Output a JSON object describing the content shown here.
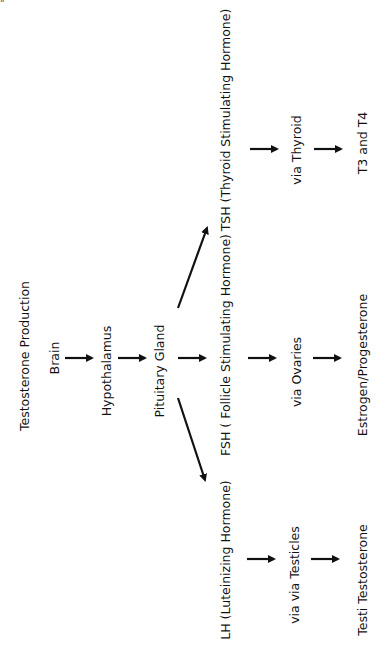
{
  "corner_mark": "\"",
  "title": "Testosterone Production",
  "chain": {
    "brain": "Brain",
    "hypothalamus": "Hypothalamus",
    "pituitary": "Pituitary Gland"
  },
  "branches": {
    "tsh": {
      "hormone": "TSH (Thyroid Stimulating Hormone)",
      "via": "via Thyroid",
      "product": "T3 and T4"
    },
    "fsh": {
      "hormone": "FSH ( Follicle Stimulating Hormone)",
      "via": "via Ovaries",
      "product": "Estrogen/Progesterone"
    },
    "lh": {
      "hormone": "LH (Luteinizing Hormone)",
      "via": "via   via Testicles",
      "product": "Testi Testosterone"
    }
  },
  "colors": {
    "ink": "#111111",
    "background": "#ffffff"
  }
}
